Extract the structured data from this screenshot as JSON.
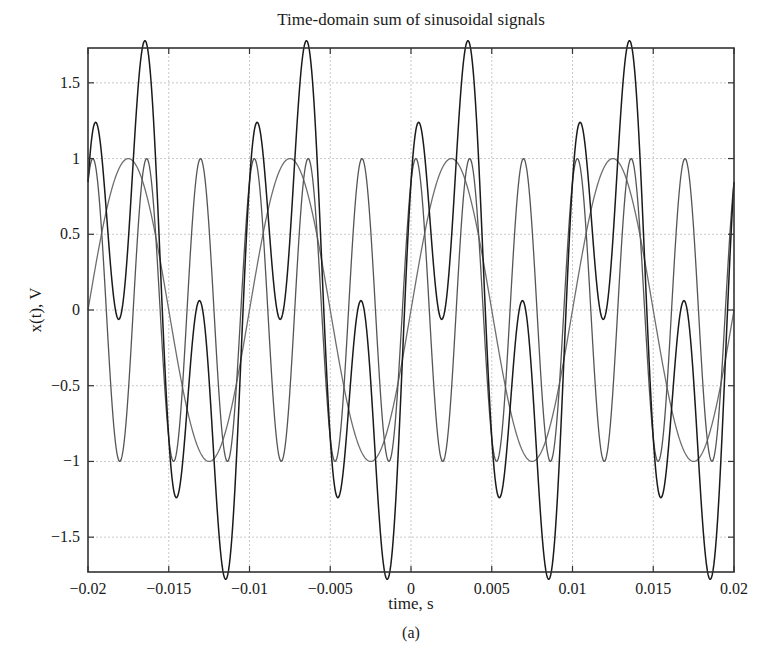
{
  "chart_data": {
    "type": "line",
    "title": "Time-domain sum of sinusoidal signals",
    "xlabel": "time, s",
    "ylabel": "x(t), V",
    "caption": "(a)",
    "xlim": [
      -0.02,
      0.02
    ],
    "ylim": [
      -1.73,
      1.73
    ],
    "grid": true,
    "legend": null,
    "x_ticks": [
      -0.02,
      -0.015,
      -0.01,
      -0.005,
      0,
      0.005,
      0.01,
      0.015,
      0.02
    ],
    "x_tick_labels": [
      "−0.02",
      "−0.015",
      "−0.01",
      "−0.005",
      "0",
      "0.005",
      "0.01",
      "0.015",
      "0.02"
    ],
    "y_ticks": [
      -1.5,
      -1,
      -0.5,
      0,
      0.5,
      1,
      1.5
    ],
    "y_tick_labels": [
      "−1.5",
      "−1",
      "−0.5",
      "0",
      "0.5",
      "1",
      "1.5"
    ],
    "series": [
      {
        "name": "x1(t) = sin(2π·100t)",
        "color": "#6e6e6e",
        "frequency_hz": 100,
        "amplitude": 1,
        "kind": "sin",
        "delay_s": 0,
        "x": [
          -0.02,
          -0.019,
          -0.018,
          -0.017,
          -0.016,
          -0.015,
          -0.014,
          -0.013,
          -0.012,
          -0.011,
          -0.01,
          -0.009,
          -0.008,
          -0.007,
          -0.006,
          -0.005,
          -0.004,
          -0.003,
          -0.002,
          -0.001,
          0,
          0.001,
          0.002,
          0.003,
          0.004,
          0.005,
          0.006,
          0.007,
          0.008,
          0.009,
          0.01,
          0.011,
          0.012,
          0.013,
          0.014,
          0.015,
          0.016,
          0.017,
          0.018,
          0.019,
          0.02
        ],
        "values": [
          0,
          0.588,
          0.951,
          0.951,
          0.588,
          0,
          -0.588,
          -0.951,
          -0.951,
          -0.588,
          0,
          0.588,
          0.951,
          0.951,
          0.588,
          0,
          -0.588,
          -0.951,
          -0.951,
          -0.588,
          0,
          0.588,
          0.951,
          0.951,
          0.588,
          0,
          -0.588,
          -0.951,
          -0.951,
          -0.588,
          0,
          0.588,
          0.951,
          0.951,
          0.588,
          0,
          -0.588,
          -0.951,
          -0.951,
          -0.588,
          0
        ]
      },
      {
        "name": "x2(t) = cos(2π·300(t − 0.0003))",
        "color": "#555555",
        "frequency_hz": 300,
        "amplitude": 1,
        "kind": "cos",
        "delay_s": 0.0003,
        "x": [
          -0.02,
          -0.019,
          -0.018,
          -0.017,
          -0.016,
          -0.015,
          -0.014,
          -0.013,
          -0.012,
          -0.011,
          -0.01,
          -0.009,
          -0.008,
          -0.007,
          -0.006,
          -0.005,
          -0.004,
          -0.003,
          -0.002,
          -0.001,
          0,
          0.001,
          0.002,
          0.003,
          0.004,
          0.005,
          0.006,
          0.007,
          0.008,
          0.009,
          0.01,
          0.011,
          0.012,
          0.013,
          0.014,
          0.015,
          0.016,
          0.017,
          0.018,
          0.019,
          0.02
        ],
        "values": [
          0.844,
          0.249,
          -0.998,
          0.368,
          0.771,
          -0.844,
          -0.249,
          0.998,
          -0.368,
          -0.771,
          0.844,
          0.249,
          -0.998,
          0.368,
          0.771,
          -0.844,
          -0.249,
          0.998,
          -0.368,
          -0.771,
          0.844,
          0.249,
          -0.998,
          0.368,
          0.771,
          -0.844,
          -0.249,
          0.998,
          -0.368,
          -0.771,
          0.844,
          0.249,
          -0.998,
          0.368,
          0.771,
          -0.844,
          -0.249,
          0.998,
          -0.368,
          -0.771,
          0.844
        ]
      },
      {
        "name": "x(t) = x1(t) + x2(t)",
        "color": "#1a1a1a",
        "kind": "sum",
        "peak": 1.73,
        "x": [
          -0.02,
          -0.019,
          -0.018,
          -0.017,
          -0.016,
          -0.015,
          -0.014,
          -0.013,
          -0.012,
          -0.011,
          -0.01,
          -0.009,
          -0.008,
          -0.007,
          -0.006,
          -0.005,
          -0.004,
          -0.003,
          -0.002,
          -0.001,
          0,
          0.001,
          0.002,
          0.003,
          0.004,
          0.005,
          0.006,
          0.007,
          0.008,
          0.009,
          0.01,
          0.011,
          0.012,
          0.013,
          0.014,
          0.015,
          0.016,
          0.017,
          0.018,
          0.019,
          0.02
        ],
        "values": [
          0.844,
          0.837,
          -0.047,
          1.319,
          1.359,
          -0.844,
          -0.837,
          0.047,
          -1.319,
          -1.359,
          0.844,
          0.837,
          -0.047,
          1.319,
          1.359,
          -0.844,
          -0.837,
          0.047,
          -1.319,
          -1.359,
          0.844,
          0.837,
          -0.047,
          1.319,
          1.359,
          -0.844,
          -0.837,
          0.047,
          -1.319,
          -1.359,
          0.844,
          0.837,
          -0.047,
          1.319,
          1.359,
          -0.844,
          -0.837,
          0.047,
          -1.319,
          -1.359,
          0.844
        ]
      }
    ]
  },
  "layout": {
    "plot_left": 88,
    "plot_top": 48,
    "plot_right": 734,
    "plot_bottom": 572
  }
}
